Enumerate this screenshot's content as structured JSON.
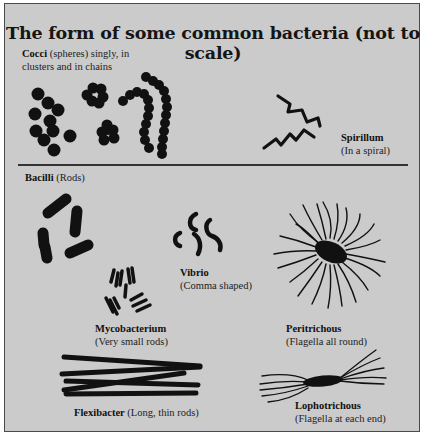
{
  "title": "The form of some common bacteria (not to scale)",
  "sections": {
    "cocci": {
      "name": "Cocci",
      "description": "(spheres) singly, in",
      "description_line2": "clusters and in chains"
    },
    "spirillum": {
      "name": "Spirillum",
      "description": "(In a spiral)"
    },
    "bacilli": {
      "name": "Bacilli",
      "description": "(Rods)"
    },
    "vibrio": {
      "name": "Vibrio",
      "description": "(Comma shaped)"
    },
    "mycobacterium": {
      "name": "Mycobacterium",
      "description": "(Very small rods)"
    },
    "peritrichous": {
      "name": "Peritrichous",
      "description": "(Flagella all round)"
    },
    "flexibacter": {
      "name": "Flexibacter",
      "description": "(Long, thin rods)"
    },
    "lophotrichous": {
      "name": "Lophotrichous",
      "description": "(Flagella at each end)"
    }
  },
  "colors": {
    "background": "#cbcbcb",
    "ink": "#111111",
    "border": "#4a4a4a"
  }
}
